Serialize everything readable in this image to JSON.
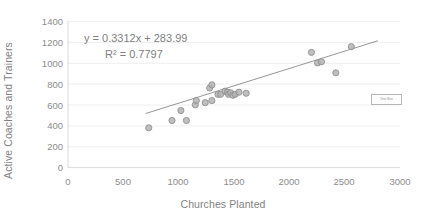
{
  "chart_data": {
    "type": "scatter",
    "title": "",
    "xlabel": "Churches Planted",
    "ylabel": "Active Coaches and Trainers",
    "xlim": [
      0,
      3000
    ],
    "ylim": [
      0,
      1400
    ],
    "xticks": [
      0,
      500,
      1000,
      1500,
      2000,
      2500,
      3000
    ],
    "yticks": [
      0,
      200,
      400,
      600,
      800,
      1000,
      1200,
      1400
    ],
    "grid": "horizontal",
    "legend": "none",
    "annotations": {
      "equation": "y = 0.3312x + 283.99",
      "r_squared": "R² = 0.7797"
    },
    "trendline": {
      "slope": 0.3312,
      "intercept": 283.99,
      "x_start": 700,
      "x_end": 2800
    },
    "series": [
      {
        "name": "Churches Planted vs Active Coaches and Trainers",
        "points": [
          [
            730,
            380
          ],
          [
            940,
            450
          ],
          [
            1070,
            450
          ],
          [
            1020,
            545
          ],
          [
            1150,
            600
          ],
          [
            1160,
            640
          ],
          [
            1300,
            640
          ],
          [
            1240,
            620
          ],
          [
            1280,
            760
          ],
          [
            1300,
            790
          ],
          [
            1355,
            700
          ],
          [
            1380,
            700
          ],
          [
            1420,
            730
          ],
          [
            1440,
            720
          ],
          [
            1450,
            700
          ],
          [
            1470,
            715
          ],
          [
            1490,
            690
          ],
          [
            1510,
            700
          ],
          [
            1545,
            720
          ],
          [
            1610,
            710
          ],
          [
            2200,
            1100
          ],
          [
            2255,
            1000
          ],
          [
            2290,
            1010
          ],
          [
            2420,
            905
          ],
          [
            2560,
            1155
          ]
        ]
      }
    ]
  },
  "axes": {
    "y_tick_labels": [
      "1400",
      "1200",
      "1000",
      "800",
      "600",
      "400",
      "200",
      "0"
    ],
    "x_tick_labels": [
      "0",
      "500",
      "1000",
      "1500",
      "2000",
      "2500",
      "3000"
    ]
  },
  "text_box": {
    "label": "Text Box"
  },
  "colors": {
    "marker_fill": "#b3b3b3",
    "marker_stroke": "#8c8c8c",
    "trendline": "#8a8a8a",
    "gridline": "#e8e8e8",
    "text": "#7f7f7f"
  }
}
